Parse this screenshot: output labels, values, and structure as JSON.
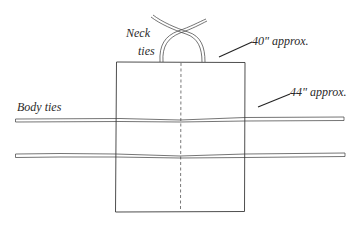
{
  "diagram": {
    "labels": {
      "neck_ties_line1": "Neck",
      "neck_ties_line2": "ties",
      "neck_measure": "40\" approx.",
      "body_measure": "44\" approx.",
      "body_ties": "Body ties"
    },
    "colors": {
      "stroke": "#3a3a3a",
      "background": "#ffffff",
      "text": "#2a2a2a"
    }
  }
}
